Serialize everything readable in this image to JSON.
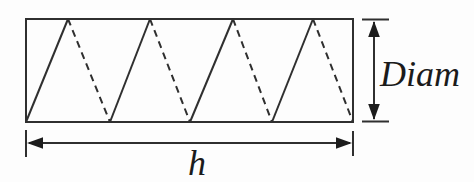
{
  "diagram": {
    "labels": {
      "diameter": "Diam",
      "height": "h"
    },
    "coil": {
      "peaks": 4,
      "front_line_style": "solid",
      "back_line_style": "dashed"
    },
    "colors": {
      "line": "#2f2f2f",
      "text": "#1b1b1b",
      "background": "#fdfdfd"
    }
  }
}
